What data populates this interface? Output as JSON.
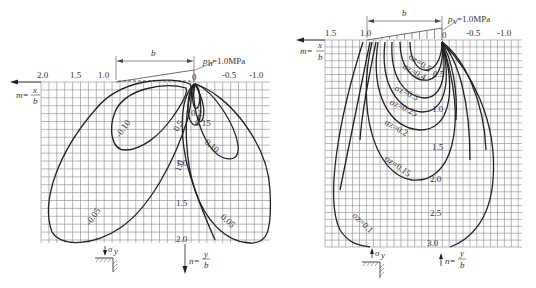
{
  "left_panel": {
    "load_label": "p",
    "load_sub": "h",
    "load_value": "=1.0MPa",
    "width_label": "b",
    "x_axis_label_num": "x",
    "x_axis_label_den": "b",
    "x_axis_prefix": "m=",
    "x_ticks": [
      "2.0",
      "1.5",
      "1.0",
      "0",
      "-0.5",
      "-1.0"
    ],
    "y_ticks": [
      "1.0",
      "1.5",
      "2.0"
    ],
    "y_axis_prefix": "n=",
    "y_axis_num": "y",
    "y_axis_den": "b",
    "stress_symbol": "σ",
    "stress_sub": "y",
    "contour_labels": [
      "-0.10",
      "-0.05",
      "0.2",
      "0.15",
      "0.5",
      "0.10",
      "1.0",
      "0.05"
    ]
  },
  "right_panel": {
    "load_label": "p",
    "load_sub": "v",
    "load_value": "=1.0MPa",
    "width_label": "b",
    "x_axis_prefix": "m=",
    "x_axis_label_num": "x",
    "x_axis_label_den": "b",
    "x_ticks": [
      "1.5",
      "1.0",
      "0",
      "-0.5",
      "-1.0"
    ],
    "y_ticks": [
      "0.5",
      "1.0",
      "1.5",
      "2.0",
      "2.5",
      "3.0"
    ],
    "y_axis_prefix": "n=",
    "y_axis_num": "y",
    "y_axis_den": "b",
    "stress_symbol": "σ",
    "stress_sub": "y",
    "contour_labels": [
      "σz=0.5",
      "σz=0.4",
      "σz=0.3",
      "σz=0.25",
      "σz=0.2",
      "σz=0.15",
      "σz=0.1"
    ]
  }
}
